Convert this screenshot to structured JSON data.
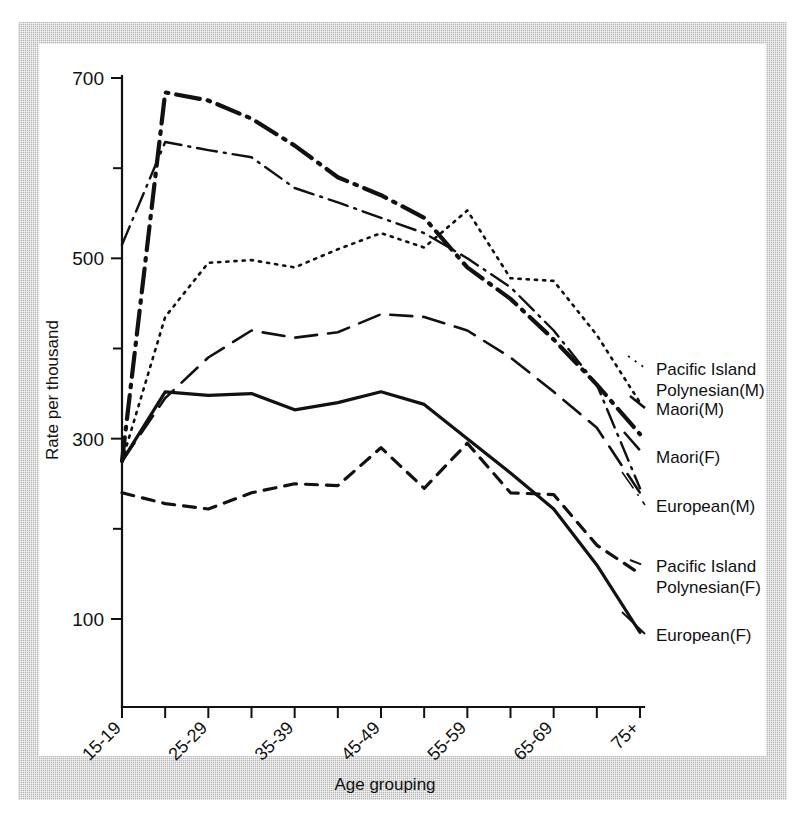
{
  "figure": {
    "frame_color": "#b9b9b9",
    "background": "#ffffff",
    "ink_color": "#111111"
  },
  "axes": {
    "ylabel": "Rate per thousand",
    "xlabel": "Age grouping",
    "y_ticks_major": [
      "700",
      "500",
      "300",
      "100"
    ],
    "y_tick_major_values": [
      700,
      500,
      300,
      100
    ],
    "y_tick_minor_values": [
      600,
      400,
      200
    ],
    "ylim": [
      50,
      700
    ],
    "x_tick_labels_shown": [
      "15-19",
      "25-29",
      "35-39",
      "45-49",
      "55-59",
      "65-69",
      "75+"
    ]
  },
  "legend": {
    "entries": [
      {
        "key": "pi_polynesian_m",
        "line1": "Pacific Island",
        "line2": "Polynesian(M)"
      },
      {
        "key": "maori_m",
        "line1": "Maori(M)",
        "line2": ""
      },
      {
        "key": "maori_f",
        "line1": "Maori(F)",
        "line2": ""
      },
      {
        "key": "european_m",
        "line1": "European(M)",
        "line2": ""
      },
      {
        "key": "pi_polynesian_f",
        "line1": "Pacific Island",
        "line2": "Polynesian(F)"
      },
      {
        "key": "european_f",
        "line1": "European(F)",
        "line2": ""
      }
    ]
  },
  "chart_data": {
    "type": "line",
    "title": "",
    "xlabel": "Age grouping",
    "ylabel": "Rate per thousand",
    "ylim": [
      50,
      700
    ],
    "grid": false,
    "legend_position": "right-inline",
    "categories": [
      "15-19",
      "20-24",
      "25-29",
      "30-34",
      "35-39",
      "40-44",
      "45-49",
      "50-54",
      "55-59",
      "60-64",
      "65-69",
      "70-74",
      "75+"
    ],
    "series": [
      {
        "name": "Maori(M)",
        "style": "thick-dash-dot",
        "values": [
          275,
          684,
          675,
          655,
          625,
          590,
          570,
          545,
          490,
          455,
          410,
          360,
          305
        ]
      },
      {
        "name": "European(M)",
        "style": "thin-dash-dot",
        "values": [
          515,
          629,
          620,
          612,
          578,
          562,
          545,
          528,
          500,
          468,
          420,
          360,
          245
        ]
      },
      {
        "name": "Pacific Island Polynesian(M)",
        "style": "dotted",
        "values": [
          275,
          435,
          495,
          498,
          490,
          510,
          528,
          512,
          553,
          478,
          475,
          415,
          340
        ]
      },
      {
        "name": "Maori(F)",
        "style": "long-dash",
        "values": [
          275,
          345,
          390,
          420,
          412,
          418,
          438,
          435,
          420,
          390,
          352,
          312,
          240
        ]
      },
      {
        "name": "European(F)",
        "style": "solid",
        "values": [
          275,
          352,
          348,
          350,
          332,
          340,
          352,
          338,
          300,
          262,
          222,
          160,
          85
        ]
      },
      {
        "name": "Pacific Island Polynesian(F)",
        "style": "short-dash",
        "values": [
          240,
          228,
          222,
          240,
          250,
          248,
          290,
          245,
          295,
          240,
          238,
          182,
          150
        ]
      }
    ]
  }
}
